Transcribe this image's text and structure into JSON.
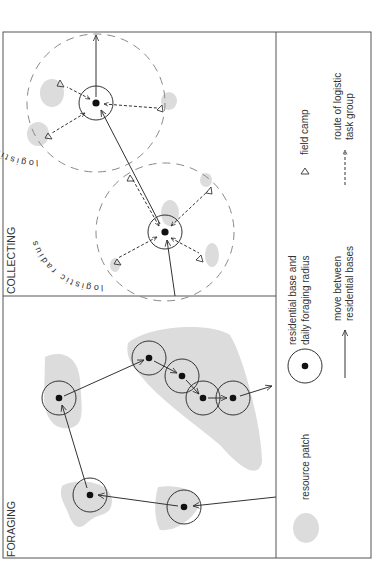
{
  "figure": {
    "orientation": "rotated-90-ccw",
    "panels": [
      {
        "id": "foraging",
        "title": "FORAGING"
      },
      {
        "id": "collecting",
        "title": "COLLECTING"
      }
    ],
    "labels": {
      "foraging_title": "FORAGING",
      "collecting_title": "COLLECTING",
      "logistic_radius_1": "logistic radius",
      "logistic_radius_2": "logistic radius"
    },
    "legend": {
      "resource_patch": "resource patch",
      "residential_base_1": "residential base and",
      "residential_base_2": "daily foraging radius",
      "move_1": "move between",
      "move_2": "residential bases",
      "field_camp": "field camp",
      "route_1": "route of logistic",
      "route_2": "task group"
    },
    "colors": {
      "patch": "#dcdcdc",
      "line": "#333333",
      "dashed": "#8a8a8a",
      "frame": "#555555"
    }
  }
}
